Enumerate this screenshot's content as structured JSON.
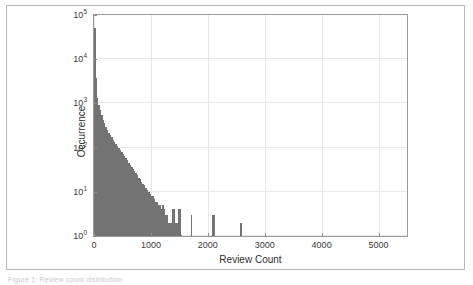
{
  "figure": {
    "caption_sliver": "Figure 1: Review count distribution",
    "border_color": "#b9b9b9"
  },
  "chart_data": {
    "type": "bar",
    "title": "",
    "subtitle": "",
    "xlabel": "Review Count",
    "ylabel": "Occurrence",
    "xlim": [
      0,
      5500
    ],
    "ylim": [
      1,
      100000
    ],
    "yscale": "log",
    "xscale": "linear",
    "grid": true,
    "legend": null,
    "bar_color": "#737373",
    "bin_width": 25,
    "xtick_labels": [
      "0",
      "1000",
      "2000",
      "3000",
      "4000",
      "5000"
    ],
    "xtick_values": [
      0,
      1000,
      2000,
      3000,
      4000,
      5000
    ],
    "ytick_labels": [
      "10^0",
      "10^1",
      "10^2",
      "10^3",
      "10^4",
      "10^5"
    ],
    "ytick_values": [
      1,
      10,
      100,
      1000,
      10000,
      100000
    ],
    "ytick_mantissa": [
      "10",
      "10",
      "10",
      "10",
      "10",
      "10"
    ],
    "ytick_exponent": [
      "0",
      "1",
      "2",
      "3",
      "4",
      "5"
    ],
    "x": [
      12,
      37,
      62,
      87,
      112,
      137,
      162,
      187,
      212,
      237,
      262,
      287,
      312,
      337,
      362,
      387,
      412,
      437,
      462,
      487,
      512,
      537,
      562,
      587,
      612,
      637,
      662,
      687,
      712,
      737,
      762,
      787,
      812,
      837,
      862,
      887,
      912,
      937,
      962,
      987,
      1012,
      1037,
      1062,
      1087,
      1112,
      1137,
      1162,
      1187,
      1212,
      1237,
      1262,
      1287,
      1312,
      1337,
      1362,
      1387,
      1412,
      1437,
      1462,
      1487,
      1512,
      1537,
      1712,
      2087,
      2112,
      2587
    ],
    "values": [
      52000,
      3800,
      1300,
      900,
      700,
      560,
      430,
      360,
      300,
      250,
      215,
      190,
      170,
      150,
      135,
      120,
      110,
      98,
      88,
      80,
      72,
      64,
      58,
      52,
      46,
      41,
      37,
      33,
      30,
      27,
      24,
      21,
      19,
      17,
      15,
      14,
      12,
      11,
      10,
      9,
      8,
      8,
      7,
      6,
      6,
      5,
      5,
      4,
      5,
      4,
      3,
      3,
      2,
      2,
      2,
      4,
      4,
      2,
      2,
      4,
      4,
      1,
      3,
      3,
      3,
      2
    ]
  },
  "axes": {
    "x_axis_name": "x-axis",
    "y_axis_name": "y-axis"
  }
}
